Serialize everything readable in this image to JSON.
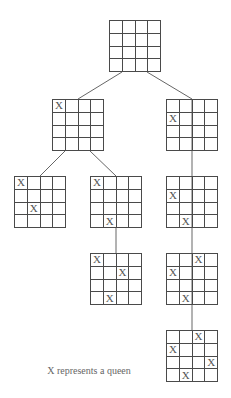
{
  "diagram": {
    "caption": "X represents a queen",
    "queen_symbol": "X",
    "colors": {
      "line": "#4a4a4a",
      "queen_text": "#555555",
      "caption_text": "#666666",
      "background": "#ffffff"
    },
    "board_size": 4,
    "nodes": [
      {
        "id": "root",
        "x": 109,
        "y": 20,
        "queens": []
      },
      {
        "id": "n1-left",
        "x": 52,
        "y": 99,
        "queens": [
          [
            0,
            0
          ]
        ]
      },
      {
        "id": "n1-right",
        "x": 166,
        "y": 99,
        "queens": [
          [
            1,
            0
          ]
        ]
      },
      {
        "id": "n2-left-left",
        "x": 14,
        "y": 176,
        "queens": [
          [
            0,
            0
          ],
          [
            2,
            1
          ]
        ]
      },
      {
        "id": "n2-left-right",
        "x": 90,
        "y": 176,
        "queens": [
          [
            0,
            0
          ],
          [
            3,
            1
          ]
        ]
      },
      {
        "id": "n2-right",
        "x": 166,
        "y": 176,
        "queens": [
          [
            1,
            0
          ],
          [
            3,
            1
          ]
        ]
      },
      {
        "id": "n3-left",
        "x": 90,
        "y": 253,
        "queens": [
          [
            0,
            0
          ],
          [
            3,
            1
          ],
          [
            1,
            2
          ]
        ]
      },
      {
        "id": "n3-right",
        "x": 166,
        "y": 253,
        "queens": [
          [
            1,
            0
          ],
          [
            3,
            1
          ],
          [
            0,
            2
          ]
        ]
      },
      {
        "id": "n4-right",
        "x": 166,
        "y": 330,
        "queens": [
          [
            1,
            0
          ],
          [
            3,
            1
          ],
          [
            0,
            2
          ],
          [
            2,
            3
          ]
        ]
      }
    ],
    "edges": [
      {
        "from": "root",
        "to": "n1-left",
        "x1": 122,
        "y1": 72,
        "x2": 78,
        "y2": 99
      },
      {
        "from": "root",
        "to": "n1-right",
        "x1": 147,
        "y1": 72,
        "x2": 192,
        "y2": 99
      },
      {
        "from": "n1-left",
        "to": "n2-left-left",
        "x1": 65,
        "y1": 151,
        "x2": 40,
        "y2": 176
      },
      {
        "from": "n1-left",
        "to": "n2-left-right",
        "x1": 90,
        "y1": 151,
        "x2": 116,
        "y2": 176
      },
      {
        "from": "n1-right",
        "to": "n2-right",
        "x1": 192,
        "y1": 99,
        "x2": 192,
        "y2": 176
      },
      {
        "from": "n2-left-right",
        "to": "n3-left",
        "x1": 116,
        "y1": 228,
        "x2": 116,
        "y2": 253
      },
      {
        "from": "n2-right",
        "to": "n3-right",
        "x1": 192,
        "y1": 176,
        "x2": 192,
        "y2": 253
      },
      {
        "from": "n3-right",
        "to": "n4-right",
        "x1": 192,
        "y1": 253,
        "x2": 192,
        "y2": 330
      }
    ]
  }
}
